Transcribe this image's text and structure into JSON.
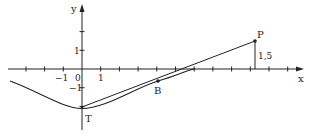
{
  "figure": {
    "type": "coordinate-geometry-diagram",
    "colors": {
      "ink": "#222222",
      "background": "#ffffff"
    },
    "axes": {
      "x_label": "x",
      "y_label": "y",
      "origin_label": "0",
      "x_tick_labels": [
        {
          "value": -1,
          "text": "−1"
        },
        {
          "value": 1,
          "text": "1"
        }
      ],
      "y_tick_labels": [
        {
          "value": 1,
          "text": "1"
        },
        {
          "value": -1,
          "text": "−1"
        }
      ]
    },
    "points": {
      "T": {
        "label": "T",
        "x": 0,
        "y": -2
      },
      "B": {
        "label": "B",
        "x": 4,
        "y": -0.65
      },
      "P": {
        "label": "P",
        "x": 9.25,
        "y": 1.5
      }
    },
    "annotations": {
      "p_height": "1,5"
    },
    "elements": [
      "curve through T and B, tangent to line TP region",
      "straight line segment from T to P",
      "vertical segment from P down to x-axis labelled 1,5"
    ]
  }
}
